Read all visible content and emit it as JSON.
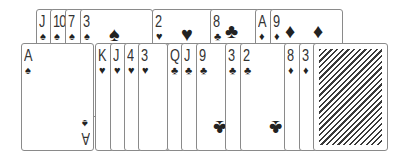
{
  "table": {
    "top_row": [
      {
        "rank": "J",
        "suit": "♠"
      },
      {
        "rank": "10",
        "suit": "♠"
      },
      {
        "rank": "7",
        "suit": "♠"
      },
      {
        "rank": "3",
        "suit": "♠"
      },
      {
        "rank": "2",
        "suit": "♥"
      },
      {
        "rank": "8",
        "suit": "♣"
      },
      {
        "rank": "A",
        "suit": "♦"
      },
      {
        "rank": "9",
        "suit": "♦"
      }
    ],
    "bottom_row": [
      {
        "rank": "A",
        "suit": "♠"
      },
      {
        "rank": "K",
        "suit": "♥"
      },
      {
        "rank": "J",
        "suit": "♥"
      },
      {
        "rank": "4",
        "suit": "♥"
      },
      {
        "rank": "3",
        "suit": "♥"
      },
      {
        "rank": "Q",
        "suit": "♣"
      },
      {
        "rank": "J",
        "suit": "♣"
      },
      {
        "rank": "9",
        "suit": "♣"
      },
      {
        "rank": "3",
        "suit": "♣"
      },
      {
        "rank": "2",
        "suit": "♣"
      },
      {
        "rank": "8",
        "suit": "♦"
      },
      {
        "rank": "3",
        "suit": "♦"
      }
    ],
    "card_back": "face-down-card"
  }
}
